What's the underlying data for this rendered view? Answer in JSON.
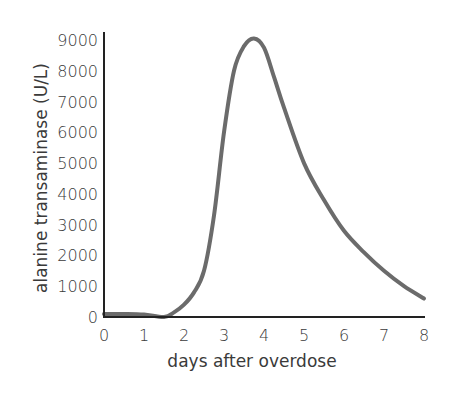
{
  "chart_data": {
    "type": "line",
    "title": "",
    "xlabel": "days after overdose",
    "ylabel": "alanine transaminase (U/L)",
    "xlim": [
      0,
      8
    ],
    "ylim": [
      0,
      9000
    ],
    "x_ticks": [
      0,
      1,
      2,
      3,
      4,
      5,
      6,
      7,
      8
    ],
    "y_ticks": [
      0,
      1000,
      2000,
      3000,
      4000,
      5000,
      6000,
      7000,
      8000,
      9000
    ],
    "grid": false,
    "legend": null,
    "series": [
      {
        "name": "ALT",
        "color": "#6b6b6b",
        "x": [
          0,
          0.5,
          1,
          1.5,
          1.75,
          2,
          2.25,
          2.5,
          2.75,
          3,
          3.25,
          3.5,
          3.75,
          4,
          4.25,
          4.5,
          5,
          5.5,
          6,
          6.5,
          7,
          7.5,
          8
        ],
        "y": [
          100,
          100,
          80,
          0,
          150,
          400,
          800,
          1500,
          3300,
          6000,
          8000,
          8800,
          9050,
          8750,
          7800,
          6800,
          5000,
          3800,
          2800,
          2100,
          1500,
          1000,
          600
        ]
      }
    ]
  },
  "colors": {
    "axis": "#222222",
    "line": "#6b6b6b",
    "text": "#3a3a3a"
  }
}
